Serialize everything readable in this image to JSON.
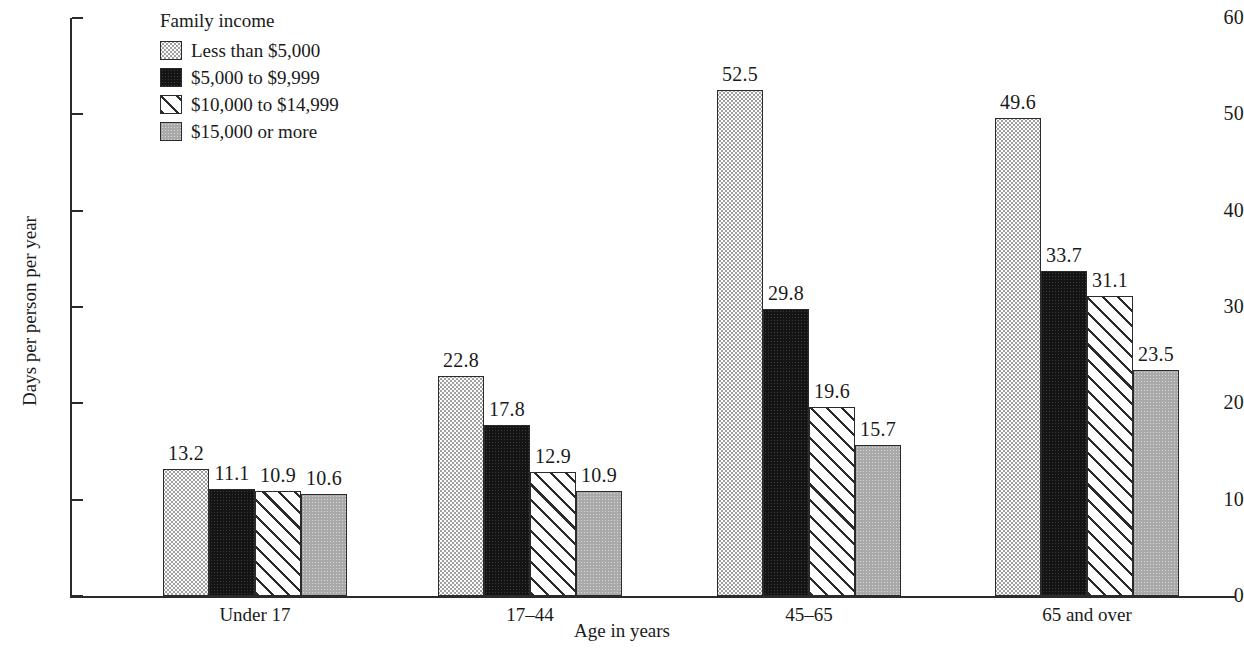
{
  "chart_data": {
    "type": "bar",
    "title": "",
    "xlabel": "Age in years",
    "ylabel": "Days per person per year",
    "categories": [
      "Under 17",
      "17–44",
      "45–65",
      "65 and over"
    ],
    "ylim": [
      0,
      60
    ],
    "yticks": [
      0,
      10,
      20,
      30,
      40,
      50,
      60
    ],
    "ytick_labels": [
      "0",
      "10",
      "20",
      "30",
      "40",
      "50",
      "60"
    ],
    "grid": false,
    "legend_title": "Family income",
    "legend_position": "top-left inside",
    "series": [
      {
        "name": "Less than $5,000",
        "pattern": "dotted",
        "values": [
          13.2,
          11.1,
          52.5,
          49.6
        ],
        "labels": [
          "13.2",
          "22.8",
          "52.5",
          "49.6"
        ]
      },
      {
        "name": "$5,000 to $9,999",
        "pattern": "black",
        "values": [
          11.1,
          17.8,
          29.8,
          33.7
        ],
        "labels": [
          "11.1",
          "17.8",
          "29.8",
          "33.7"
        ]
      },
      {
        "name": "$10,000 to $14,999",
        "pattern": "hatch",
        "values": [
          10.9,
          12.9,
          19.6,
          31.1
        ],
        "labels": [
          "10.9",
          "12.9",
          "19.6",
          "31.1"
        ]
      },
      {
        "name": "$15,000 or more",
        "pattern": "gray",
        "values": [
          10.6,
          10.9,
          15.7,
          23.5
        ],
        "labels": [
          "10.6",
          "10.9",
          "15.7",
          "23.5"
        ]
      }
    ],
    "groups": [
      {
        "category": "Under 17",
        "values": [
          13.2,
          11.1,
          10.9,
          10.6
        ]
      },
      {
        "category": "17–44",
        "values": [
          22.8,
          17.8,
          12.9,
          10.9
        ]
      },
      {
        "category": "45–65",
        "values": [
          52.5,
          29.8,
          19.6,
          15.7
        ]
      },
      {
        "category": "65 and over",
        "values": [
          49.6,
          33.7,
          31.1,
          23.5
        ]
      }
    ],
    "colors": {
      "axis": "#2b2b2b",
      "text": "#1a1a1a",
      "series_dotted": "#fbfbfb",
      "series_black": "#141414",
      "series_hatch": "#ffffff",
      "series_gray": "#a9a9a9",
      "background": "#ffffff"
    }
  },
  "legend": {
    "title": "Family income",
    "items": [
      {
        "label": "Less than $5,000",
        "pattern": "dotted"
      },
      {
        "label": "$5,000 to $9,999",
        "pattern": "black"
      },
      {
        "label": "$10,000 to $14,999",
        "pattern": "hatch"
      },
      {
        "label": "$15,000 or more",
        "pattern": "gray"
      }
    ]
  },
  "axes": {
    "y_title": "Days per person per year",
    "x_title": "Age in years"
  }
}
